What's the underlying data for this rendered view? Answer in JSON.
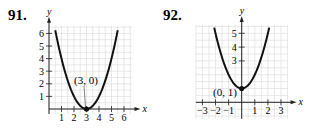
{
  "problems": [
    {
      "number": "91.",
      "point_label": "(3, 0)"
    },
    {
      "number": "92.",
      "point_label": "(0, 1)"
    }
  ],
  "chart_data": [
    {
      "type": "line",
      "title": "91.",
      "xlabel": "x",
      "ylabel": "y",
      "x_ticks": [
        1,
        2,
        3,
        4,
        5,
        6
      ],
      "y_ticks": [
        1,
        2,
        3,
        4,
        5,
        6
      ],
      "xlim": [
        0,
        6.5
      ],
      "ylim": [
        0,
        6.5
      ],
      "grid": true,
      "curve": "y = (x - 3)^2",
      "x": [
        0.5,
        1,
        1.5,
        2,
        2.5,
        3,
        3.5,
        4,
        4.5,
        5,
        5.5
      ],
      "y": [
        6.25,
        4,
        2.25,
        1,
        0.25,
        0,
        0.25,
        1,
        2.25,
        4,
        6.25
      ],
      "annotations": [
        {
          "text": "(3, 0)",
          "x": 3,
          "y": 0
        }
      ]
    },
    {
      "type": "line",
      "title": "92.",
      "xlabel": "x",
      "ylabel": "y",
      "x_ticks": [
        -3,
        -2,
        -1,
        1,
        2,
        3
      ],
      "y_ticks": [
        3,
        4,
        5
      ],
      "xlim": [
        -3.5,
        3.5
      ],
      "ylim": [
        -1,
        5.5
      ],
      "grid": true,
      "curve": "y = x^2 + 1",
      "x": [
        -2.1,
        -2,
        -1.5,
        -1,
        -0.5,
        0,
        0.5,
        1,
        1.5,
        2,
        2.1
      ],
      "y": [
        5.41,
        5,
        3.25,
        2,
        1.25,
        1,
        1.25,
        2,
        3.25,
        5,
        5.41
      ],
      "annotations": [
        {
          "text": "(0, 1)",
          "x": 0,
          "y": 1
        }
      ]
    }
  ]
}
